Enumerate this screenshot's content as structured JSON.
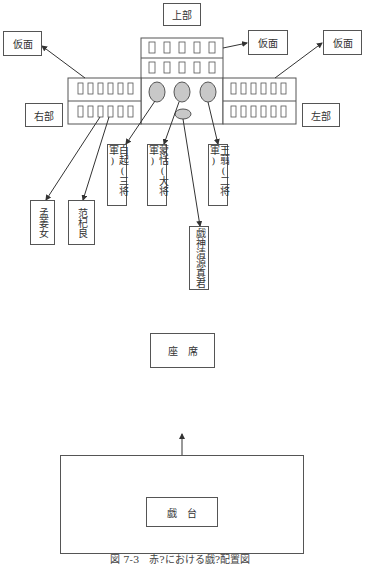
{
  "diagram": {
    "top_label": "上部",
    "left_label": "右部",
    "right_label": "左部",
    "masks": [
      "仮面",
      "仮面",
      "仮面"
    ],
    "figures": [
      {
        "id": "bai-qi",
        "text": "白起(三将軍)"
      },
      {
        "id": "meng-tian",
        "text": "蒙恬(大将軍)"
      },
      {
        "id": "wang-jian",
        "text": "王翦(二将軍)"
      },
      {
        "id": "meng-jiang-nu",
        "text": "孟姜女"
      },
      {
        "id": "fan-qi-liang",
        "text": "范杞良"
      },
      {
        "id": "xishen",
        "text": "戯神清源真君"
      }
    ],
    "seats_label": "座　席",
    "stage_label": "戯　台",
    "caption": "図 7-3　赤?における戯?配置図"
  },
  "colors": {
    "line": "#333333",
    "box_border": "#555555",
    "ellipse_fill": "#c8c8c8",
    "background": "#ffffff"
  }
}
